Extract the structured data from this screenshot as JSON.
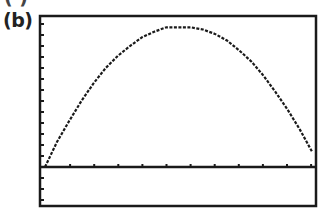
{
  "figure": {
    "panel_label": "(b)",
    "cut_label": "( )"
  },
  "chart_data": {
    "type": "line",
    "title": "",
    "xlabel": "",
    "ylabel": "",
    "grid": false,
    "legend": null,
    "x_ticks_count": 11,
    "y_ticks_above_axis": 13,
    "y_ticks_below_axis": 3,
    "xlim": [
      0,
      11
    ],
    "ylim": [
      -3.5,
      13.5
    ],
    "x": [
      0,
      0.5,
      1,
      1.5,
      2,
      2.5,
      3,
      3.5,
      4,
      4.5,
      5,
      5.5,
      6,
      6.5,
      7,
      7.5,
      8,
      8.5,
      9,
      9.5,
      10,
      10.5,
      11
    ],
    "y": [
      0,
      2.3,
      4.2,
      6.0,
      7.6,
      9.0,
      10.1,
      11.0,
      11.8,
      12.3,
      12.7,
      12.7,
      12.7,
      12.5,
      12.1,
      11.5,
      10.6,
      9.6,
      8.3,
      6.8,
      5.2,
      3.4,
      1.4
    ],
    "frame": {
      "left": 40,
      "top": 16,
      "right": 316,
      "bottom": 206
    },
    "x_axis_pixel_y": 167,
    "colors": {
      "curve": "#1a1a1a",
      "axis": "#1a1a1a",
      "frame": "#1a1a1a",
      "background": "#ffffff"
    }
  }
}
